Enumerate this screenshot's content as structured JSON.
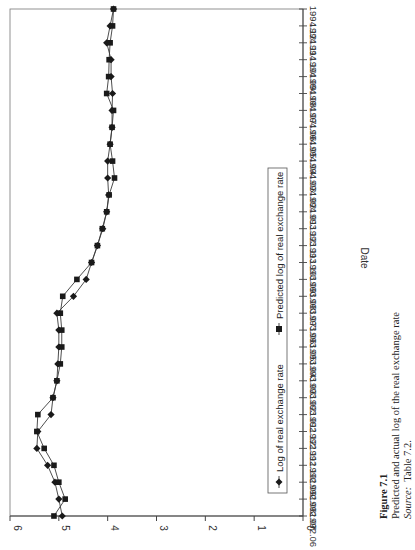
{
  "chart_data": {
    "type": "line",
    "orientation": "rotated-90-ccw",
    "title": "",
    "xlabel": "Date",
    "ylabel": "",
    "ylim": [
      0,
      6
    ],
    "yticks": [
      0,
      1,
      2,
      3,
      4,
      5,
      6
    ],
    "grid": false,
    "legend_position": "inside, lower-right (boxed)",
    "categories": [
      "1992.06",
      "1992.07",
      "1992.08",
      "1992.09",
      "1992.10",
      "1992.11",
      "1992.12",
      "1993.01",
      "1993.02",
      "1993.03",
      "1993.04",
      "1993.05",
      "1993.06",
      "1993.07",
      "1993.08",
      "1993.09",
      "1993.10",
      "1993.11",
      "1993.12",
      "1994.01",
      "1994.02",
      "1994.03",
      "1994.04",
      "1994.05",
      "1994.06",
      "1994.07",
      "1994.08",
      "1994.09",
      "1994.10",
      "1994.11",
      "1994.12"
    ],
    "series": [
      {
        "name": "Log of real exchange rate",
        "marker": "diamond",
        "values": [
          4.93,
          5.0,
          5.08,
          5.23,
          5.45,
          5.43,
          5.16,
          5.12,
          5.04,
          5.02,
          5.0,
          5.0,
          5.04,
          4.7,
          4.44,
          4.33,
          4.21,
          4.1,
          4.02,
          3.98,
          4.0,
          4.0,
          3.95,
          3.91,
          3.91,
          3.9,
          3.93,
          3.93,
          4.02,
          3.95,
          3.88
        ]
      },
      {
        "name": "Predicted log of real exchange rate",
        "marker": "square",
        "values": [
          5.1,
          4.87,
          5.0,
          5.1,
          5.3,
          5.45,
          5.43,
          5.12,
          5.04,
          4.97,
          4.94,
          4.94,
          4.97,
          4.92,
          4.63,
          4.33,
          4.21,
          4.11,
          4.02,
          3.97,
          3.86,
          3.9,
          3.95,
          3.91,
          3.88,
          4.02,
          3.98,
          3.97,
          3.95,
          3.9,
          3.88
        ]
      }
    ]
  },
  "legend": {
    "items": [
      {
        "label": "Log of real exchange rate",
        "marker": "diamond"
      },
      {
        "label": "Predicted log of real exchange rate",
        "marker": "square"
      }
    ]
  },
  "caption": {
    "figure_label": "Figure 7.1",
    "description": "Predicted and actual log of the real exchange rate",
    "source_label": "Source:",
    "source_text": "Table 7.2."
  },
  "colors": {
    "line": "#3a3a3a",
    "marker": "#1a1a1a",
    "axis": "#555555",
    "text": "#222222"
  }
}
